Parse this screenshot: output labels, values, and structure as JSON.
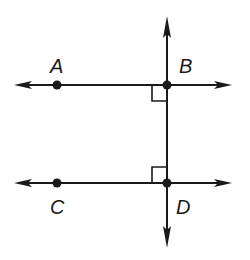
{
  "diagram": {
    "colors": {
      "stroke": "#1a1a1a",
      "background": "#ffffff"
    },
    "points": {
      "A": {
        "label": "A",
        "x": 57,
        "y": 85
      },
      "B": {
        "label": "B",
        "x": 167,
        "y": 85
      },
      "C": {
        "label": "C",
        "x": 57,
        "y": 183
      },
      "D": {
        "label": "D",
        "x": 167,
        "y": 183
      }
    },
    "lines": [
      {
        "name": "line-AB",
        "orientation": "horizontal",
        "through": [
          "A",
          "B"
        ],
        "arrows": "both"
      },
      {
        "name": "line-CD",
        "orientation": "horizontal",
        "through": [
          "C",
          "D"
        ],
        "arrows": "both"
      },
      {
        "name": "line-BD",
        "orientation": "vertical",
        "through": [
          "B",
          "D"
        ],
        "arrows": "both"
      }
    ],
    "right_angles": [
      {
        "at": "B",
        "between": [
          "line-AB",
          "line-BD"
        ]
      },
      {
        "at": "D",
        "between": [
          "line-CD",
          "line-BD"
        ]
      }
    ]
  }
}
